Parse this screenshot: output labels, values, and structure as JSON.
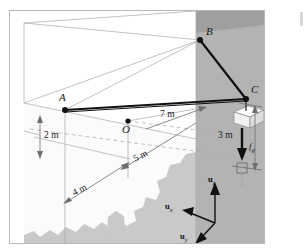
{
  "figure": {
    "type": "statics-free-body-diagram"
  },
  "points": [
    {
      "id": "A",
      "label": "A",
      "x": 55,
      "y": 99
    },
    {
      "id": "B",
      "label": "B",
      "x": 190,
      "y": 29
    },
    {
      "id": "C",
      "label": "C",
      "x": 236,
      "y": 88
    },
    {
      "id": "O",
      "label": "O",
      "x": 118,
      "y": 110
    }
  ],
  "dimensions": [
    {
      "label": "2 m",
      "axis": "z",
      "value": 2,
      "unit": "m"
    },
    {
      "label": "4 m",
      "axis": "y",
      "value": 4,
      "unit": "m"
    },
    {
      "label": "5 m",
      "axis": "y",
      "value": 5,
      "unit": "m"
    },
    {
      "label": "7 m",
      "axis": "x",
      "value": 7,
      "unit": "m"
    },
    {
      "label": "3 m",
      "axis": "z",
      "value": 3,
      "unit": "m"
    }
  ],
  "force": {
    "symbol": "f",
    "subscript": "g",
    "label": "f",
    "direction": "downward"
  },
  "axes": [
    {
      "id": "uz",
      "base": "u",
      "sub": "z",
      "label": "u",
      "direction": "up"
    },
    {
      "id": "ux",
      "base": "u",
      "sub": "x",
      "label": "u",
      "direction": "left"
    },
    {
      "id": "uy",
      "base": "u",
      "sub": "y",
      "label": "u",
      "direction": "down-left"
    }
  ],
  "colors": {
    "wall_light": "#ffffff",
    "wall_shade": "#b3b3b3",
    "ground_blob": "#c9c9c9",
    "cable": "#1a1a1a",
    "construction_line": "#9a9a9a",
    "crate_top": "#ffffff",
    "crate_side": "#e8e8e8",
    "border": "#b9b9b9"
  }
}
